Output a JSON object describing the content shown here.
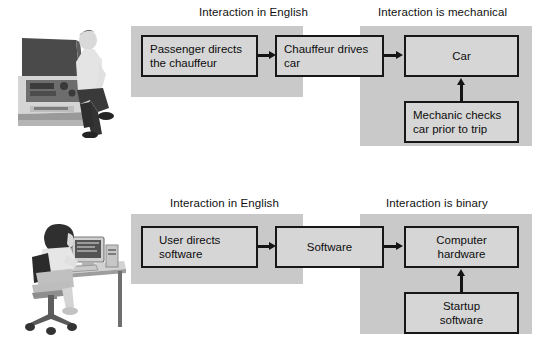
{
  "figure": {
    "sections": [
      {
        "id": "car",
        "illustration_name": "man-leaning-on-car-with-open-hood-photo",
        "headers": [
          {
            "label": "Interaction in English"
          },
          {
            "label": "Interaction is mechanical"
          }
        ],
        "boxes": [
          {
            "id": "passenger",
            "label": "Passenger directs\nthe chauffeur",
            "lines": [
              "Passenger directs",
              "the chauffeur"
            ]
          },
          {
            "id": "chauffeur",
            "label": "Chauffeur drives\ncar",
            "lines": [
              "Chauffeur drives",
              "car"
            ]
          },
          {
            "id": "car",
            "label": "Car",
            "lines": [
              "Car"
            ]
          },
          {
            "id": "mechanic",
            "label": "Mechanic checks\ncar prior to trip",
            "lines": [
              "Mechanic checks",
              "car prior to trip"
            ]
          }
        ],
        "arrows": [
          {
            "id": "passenger-to-chauffeur",
            "direction": "right"
          },
          {
            "id": "chauffeur-to-car",
            "direction": "right"
          },
          {
            "id": "mechanic-to-car",
            "direction": "up"
          }
        ]
      },
      {
        "id": "computer",
        "illustration_name": "woman-at-desk-using-computer-photo",
        "headers": [
          {
            "label": "Interaction in English"
          },
          {
            "label": "Interaction is binary"
          }
        ],
        "boxes": [
          {
            "id": "user",
            "label": "User directs\nsoftware",
            "lines": [
              "User directs",
              "software"
            ]
          },
          {
            "id": "software",
            "label": "Software",
            "lines": [
              "Software"
            ]
          },
          {
            "id": "hardware",
            "label": "Computer\nhardware",
            "lines": [
              "Computer",
              "hardware"
            ]
          },
          {
            "id": "startup",
            "label": "Startup\nsoftware",
            "lines": [
              "Startup",
              "software"
            ]
          }
        ],
        "arrows": [
          {
            "id": "user-to-software",
            "direction": "right"
          },
          {
            "id": "software-to-hardware",
            "direction": "right"
          },
          {
            "id": "startup-to-hardware",
            "direction": "up"
          }
        ]
      }
    ],
    "colors": {
      "panel_gray": "#c9c9c9",
      "box_fill": "#d6d6d6",
      "box_border": "#171717",
      "text": "#0d0d0d",
      "arrow": "#141414",
      "background": "#ffffff"
    }
  }
}
